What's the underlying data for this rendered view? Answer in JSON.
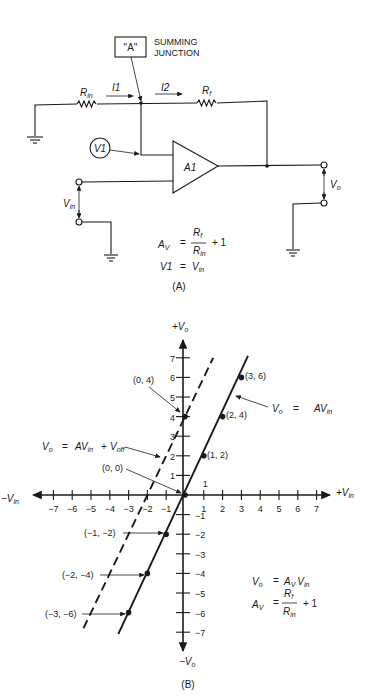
{
  "panel_a": {
    "caption": "(A)",
    "junction_box_label": "\"A\"",
    "junction_title_line1": "SUMMING",
    "junction_title_line2": "JUNCTION",
    "r_in": {
      "main": "R",
      "sub": "in"
    },
    "r_f": {
      "main": "R",
      "sub": "f"
    },
    "i1": "I1",
    "i2": "I2",
    "v1": "V1",
    "amp": "A1",
    "v_in": {
      "main": "V",
      "sub": "in"
    },
    "v_o": {
      "main": "V",
      "sub": "o"
    },
    "eq1": {
      "lhs": "A",
      "lhs_sub": "V",
      "eq": "=",
      "num": "R",
      "num_sub": "f",
      "den": "R",
      "den_sub": "in",
      "tail": "+ 1"
    },
    "eq2": {
      "lhs": "V1",
      "eq": "=",
      "rhs": "V",
      "rhs_sub": "in"
    }
  },
  "panel_b": {
    "caption": "(B)",
    "axis_labels": {
      "y_pos": {
        "sign": "+",
        "main": "V",
        "sub": "o"
      },
      "y_neg": {
        "sign": "−",
        "main": "V",
        "sub": "o"
      },
      "x_pos": {
        "sign": "+",
        "main": "V",
        "sub": "in"
      },
      "x_neg": {
        "sign": "−",
        "main": "V",
        "sub": "in"
      }
    },
    "x_ticks": [
      -7,
      -6,
      -5,
      -4,
      -3,
      -2,
      -1,
      1,
      2,
      3,
      4,
      5,
      6,
      7
    ],
    "y_ticks": [
      -7,
      -6,
      -5,
      -4,
      -3,
      -2,
      -1,
      1,
      2,
      3,
      4,
      5,
      6,
      7
    ],
    "point_labels": [
      {
        "text": "(3, 6)"
      },
      {
        "text": "(2, 4)"
      },
      {
        "text": "(1, 2)"
      },
      {
        "text": "(0, 4)"
      },
      {
        "text": "(0, 0)"
      },
      {
        "text": "(−1, −2)"
      },
      {
        "text": "(−2, −4)"
      },
      {
        "text": "(−3, −6)"
      }
    ],
    "solid_line_label": {
      "lhs": "V",
      "lhs_sub": "o",
      "eq": "=",
      "rhs": "AV",
      "rhs_sub": "in"
    },
    "dashed_line_label": {
      "lhs": "V",
      "lhs_sub": "o",
      "eq": "=",
      "rhs": "AV",
      "rhs_sub": "in",
      "plus": "+",
      "off": "V",
      "off_sub": "off"
    },
    "eq1": {
      "lhs": "V",
      "lhs_sub": "o",
      "eq": "=",
      "rhs": "A",
      "rhs_sub": "V",
      "rhs2": "V",
      "rhs2_sub": "in"
    },
    "eq2": {
      "lhs": "A",
      "lhs_sub": "V",
      "eq": "=",
      "num": "R",
      "num_sub": "f",
      "den": "R",
      "den_sub": "in",
      "tail": "+ 1"
    }
  },
  "chart_data": {
    "type": "line",
    "title": "",
    "xlabel": "V_in",
    "ylabel": "V_o",
    "xlim": [
      -7,
      7
    ],
    "ylim": [
      -7,
      7
    ],
    "grid": false,
    "series": [
      {
        "name": "Vo = AVin",
        "style": "solid",
        "x": [
          -3,
          -2,
          -1,
          0,
          1,
          2,
          3
        ],
        "y": [
          -6,
          -4,
          -2,
          0,
          2,
          4,
          6
        ]
      },
      {
        "name": "Vo = AVin + Voff",
        "style": "dashed",
        "x": [
          -5.4,
          -2,
          0,
          1.5
        ],
        "y": [
          -6.8,
          0,
          4,
          7
        ]
      }
    ],
    "marked_points": [
      [
        3,
        6
      ],
      [
        2,
        4
      ],
      [
        1,
        2
      ],
      [
        0,
        4
      ],
      [
        0,
        0
      ],
      [
        -1,
        -2
      ],
      [
        -2,
        -4
      ],
      [
        -3,
        -6
      ]
    ]
  }
}
